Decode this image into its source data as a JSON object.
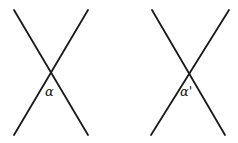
{
  "diagram": {
    "left_crossing": {
      "label": "α",
      "line1": [
        14,
        10,
        88,
        135
      ],
      "line2": [
        88,
        10,
        14,
        135
      ]
    },
    "right_crossing": {
      "label": "α'",
      "line1": [
        152,
        10,
        225,
        135
      ],
      "line2": [
        229,
        10,
        151,
        135
      ]
    },
    "stroke_color": "#1a1a1a"
  }
}
